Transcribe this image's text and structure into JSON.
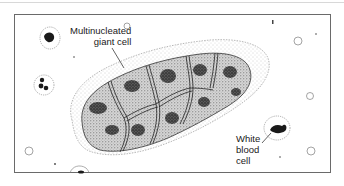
{
  "figure": {
    "type": "medical illustration",
    "labels": {
      "giant_cell": {
        "line1": "Multinucleated",
        "line2": "giant cell"
      },
      "white_blood_cell": {
        "line1": "White",
        "line2": "blood",
        "line3": "cell"
      }
    },
    "colors": {
      "ink": "#1a1a1a",
      "frame": "#6a6a6a",
      "background": "#ffffff",
      "stipple_light": "#cfcfcf",
      "stipple_dark": "#4a4a4a"
    }
  }
}
